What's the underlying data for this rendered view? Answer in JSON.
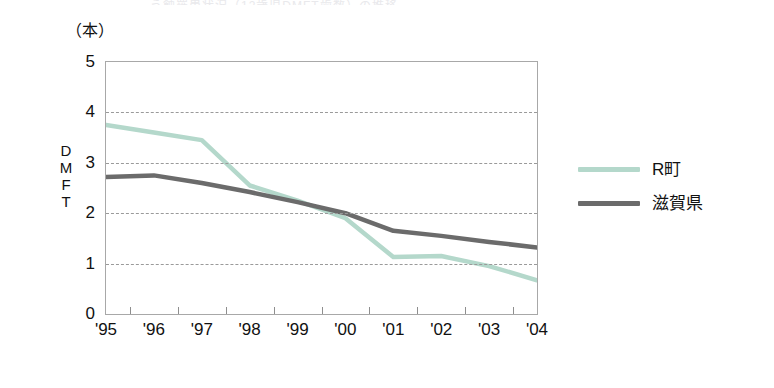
{
  "figure": {
    "title_faint": "う蝕罹患状況（12歳児DMFT歯数）の推移",
    "unit_label": "（本）",
    "y_axis_title_chars": [
      "D",
      "M",
      "F",
      "T"
    ]
  },
  "legend": {
    "position": "right",
    "items": [
      {
        "name": "R町",
        "color": "#b4d8cb"
      },
      {
        "name": "滋賀県",
        "color": "#6b6b6b"
      }
    ]
  },
  "chart_data": {
    "type": "line",
    "title": "う蝕罹患状況（12歳児DMFT歯数）の推移",
    "xlabel": "",
    "ylabel": "DMFT",
    "yunit": "（本）",
    "categories": [
      "'95",
      "'96",
      "'97",
      "'98",
      "'99",
      "'00",
      "'01",
      "'02",
      "'03",
      "'04"
    ],
    "ylim": [
      0,
      5
    ],
    "yticks": [
      0,
      1,
      2,
      3,
      4,
      5
    ],
    "grid": "horizontal-dashed",
    "legend_position": "right",
    "series": [
      {
        "name": "R町",
        "color": "#b4d8cb",
        "values": [
          3.75,
          3.6,
          3.45,
          2.55,
          2.25,
          1.9,
          1.13,
          1.15,
          0.95,
          0.67
        ]
      },
      {
        "name": "滋賀県",
        "color": "#6b6b6b",
        "values": [
          2.72,
          2.75,
          2.6,
          2.42,
          2.22,
          2.0,
          1.65,
          1.55,
          1.43,
          1.32
        ]
      }
    ]
  }
}
